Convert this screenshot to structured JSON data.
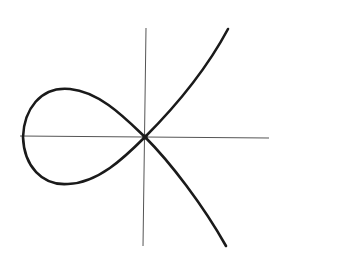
{
  "diagram": {
    "type": "nodal-cubic-curve",
    "colors": {
      "background": "#ffffff",
      "axis": "#555555",
      "curve": "#1a1a1a"
    },
    "axes": {
      "origin": [
        145,
        137
      ],
      "x_axis": {
        "from": [
          20,
          136
        ],
        "to": [
          269,
          138
        ]
      },
      "y_axis": {
        "from": [
          146,
          28
        ],
        "to": [
          143,
          246
        ]
      }
    },
    "curve": {
      "loop": "M145,137 C125,118 100,92 70,89 C40,86 24,110 23,137 C24,166 42,186 68,184 C98,183 124,158 145,137 Z",
      "upper_branch": "M145,137 C170,112 205,72 228,29",
      "lower_branch": "M145,137 C170,162 203,205 226,246",
      "node": [
        145,
        137
      ]
    }
  }
}
